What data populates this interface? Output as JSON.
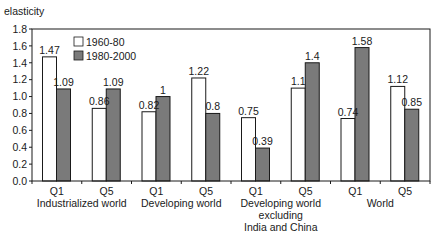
{
  "chart_data": {
    "type": "bar",
    "title": "",
    "ylabel": "elasticity",
    "xlabel": "",
    "ylim": [
      0,
      1.8
    ],
    "yticks": [
      "0.0",
      "0.2",
      "0.4",
      "0.6",
      "0.8",
      "1.0",
      "1.2",
      "1.4",
      "1.6",
      "1.8"
    ],
    "grid": false,
    "legend_position": "upper-left-inside",
    "categories": [
      "Q1",
      "Q5",
      "Q1",
      "Q5",
      "Q1",
      "Q5",
      "Q1",
      "Q5"
    ],
    "groups": [
      {
        "label": [
          "Industrialized world"
        ],
        "categories": [
          "Q1",
          "Q5"
        ]
      },
      {
        "label": [
          "Developing world"
        ],
        "categories": [
          "Q1",
          "Q5"
        ]
      },
      {
        "label": [
          "Developing world",
          "excluding",
          "India and China"
        ],
        "categories": [
          "Q1",
          "Q5"
        ]
      },
      {
        "label": [
          "World"
        ],
        "categories": [
          "Q1",
          "Q5"
        ]
      }
    ],
    "series": [
      {
        "name": "1960-80",
        "color": "#ffffff",
        "values": [
          1.47,
          0.86,
          0.82,
          1.22,
          0.75,
          1.1,
          0.74,
          1.12
        ],
        "labels": [
          "1.47",
          "0.86",
          "0.82",
          "1.22",
          "0.75",
          "1.1",
          "0.74",
          "1.12"
        ]
      },
      {
        "name": "1980-2000",
        "color": "#7a7a7a",
        "values": [
          1.09,
          1.09,
          1.0,
          0.8,
          0.39,
          1.4,
          1.58,
          0.85
        ],
        "labels": [
          "1.09",
          "1.09",
          "1",
          "0.8",
          "0.39",
          "1.4",
          "1.58",
          "0.85"
        ]
      }
    ]
  },
  "colors": {
    "axis": "#1a1a1a",
    "bar_outline": "#1a1a1a"
  }
}
